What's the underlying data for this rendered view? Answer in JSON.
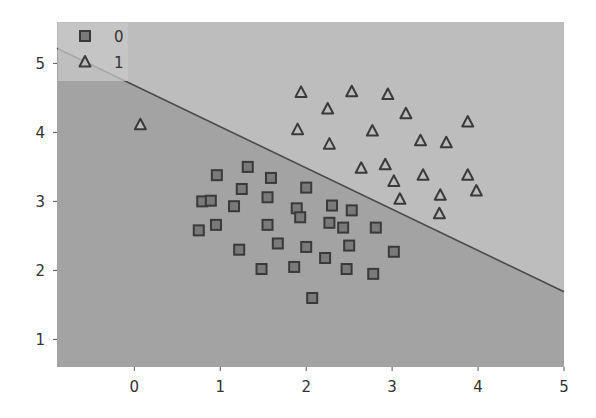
{
  "chart_data": {
    "type": "scatter",
    "title": "",
    "xlabel": "",
    "ylabel": "",
    "xlim": [
      -0.9,
      5.0
    ],
    "ylim": [
      0.6,
      5.6
    ],
    "xticks": [
      0,
      1,
      2,
      3,
      4,
      5
    ],
    "yticks": [
      1,
      2,
      3,
      4,
      5
    ],
    "grid": false,
    "legend_position": "upper left",
    "legend": [
      {
        "label": "0",
        "marker": "square"
      },
      {
        "label": "1",
        "marker": "triangle"
      }
    ],
    "decision_boundary": {
      "type": "line",
      "points": [
        [
          -0.9,
          5.22
        ],
        [
          5.0,
          1.69
        ]
      ],
      "region_above_color": "#bdbdbd",
      "region_below_color": "#a3a3a3"
    },
    "series": [
      {
        "name": "0",
        "marker": "square",
        "points": [
          [
            1.32,
            3.5
          ],
          [
            0.96,
            3.38
          ],
          [
            1.59,
            3.34
          ],
          [
            1.25,
            3.18
          ],
          [
            2.0,
            3.2
          ],
          [
            0.79,
            3.0
          ],
          [
            0.89,
            3.01
          ],
          [
            1.55,
            3.06
          ],
          [
            1.16,
            2.93
          ],
          [
            1.89,
            2.9
          ],
          [
            1.93,
            2.77
          ],
          [
            0.95,
            2.66
          ],
          [
            1.55,
            2.66
          ],
          [
            0.75,
            2.58
          ],
          [
            1.67,
            2.39
          ],
          [
            2.0,
            2.34
          ],
          [
            1.22,
            2.3
          ],
          [
            1.48,
            2.02
          ],
          [
            1.86,
            2.05
          ],
          [
            2.07,
            1.6
          ],
          [
            2.3,
            2.94
          ],
          [
            2.53,
            2.87
          ],
          [
            2.27,
            2.69
          ],
          [
            2.43,
            2.62
          ],
          [
            2.81,
            2.62
          ],
          [
            2.5,
            2.36
          ],
          [
            3.02,
            2.27
          ],
          [
            2.22,
            2.18
          ],
          [
            2.47,
            2.02
          ],
          [
            2.78,
            1.95
          ]
        ]
      },
      {
        "name": "1",
        "marker": "triangle",
        "points": [
          [
            0.07,
            4.11
          ],
          [
            1.94,
            4.58
          ],
          [
            2.53,
            4.59
          ],
          [
            2.95,
            4.55
          ],
          [
            2.25,
            4.34
          ],
          [
            3.16,
            4.27
          ],
          [
            3.88,
            4.15
          ],
          [
            1.9,
            4.04
          ],
          [
            2.77,
            4.02
          ],
          [
            2.27,
            3.83
          ],
          [
            3.33,
            3.88
          ],
          [
            3.63,
            3.85
          ],
          [
            2.64,
            3.48
          ],
          [
            2.92,
            3.53
          ],
          [
            3.36,
            3.38
          ],
          [
            3.88,
            3.38
          ],
          [
            3.02,
            3.29
          ],
          [
            3.98,
            3.15
          ],
          [
            3.09,
            3.03
          ],
          [
            3.56,
            3.09
          ],
          [
            3.55,
            2.82
          ]
        ]
      }
    ],
    "colors": {
      "marker_edge": "#3a3a3a",
      "marker_fill": "#7a7a7a",
      "line": "#4a4a4a",
      "axis_text": "#333333"
    }
  }
}
